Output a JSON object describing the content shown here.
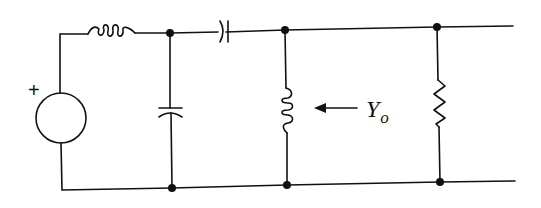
{
  "diagram": {
    "type": "circuit-schematic",
    "source": {
      "kind": "voltage-source",
      "polarity_label": "+"
    },
    "components": [
      {
        "id": "series-inductor",
        "kind": "inductor",
        "position": "series-top"
      },
      {
        "id": "shunt-capacitor",
        "kind": "capacitor",
        "position": "shunt-1"
      },
      {
        "id": "series-capacitor",
        "kind": "capacitor",
        "position": "series-top"
      },
      {
        "id": "shunt-inductor",
        "kind": "inductor",
        "position": "shunt-2"
      },
      {
        "id": "shunt-resistor",
        "kind": "resistor",
        "position": "shunt-3"
      }
    ],
    "annotation": {
      "arrow_direction": "left",
      "label_main": "Y",
      "label_sub": "o"
    },
    "colors": {
      "ink": "#111111",
      "background": "#ffffff"
    }
  }
}
